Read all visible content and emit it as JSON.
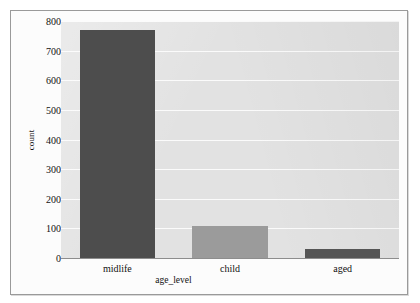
{
  "chart_data": {
    "type": "bar",
    "title": "",
    "subtitle": "",
    "xlabel": "age_level",
    "ylabel": "count",
    "categories": [
      "midlife",
      "child",
      "aged"
    ],
    "values": [
      770,
      107,
      30
    ],
    "series": [
      {
        "name": "count",
        "values": [
          770,
          107,
          30
        ]
      }
    ],
    "ylim": [
      0,
      800
    ],
    "yticks": [
      0,
      100,
      200,
      300,
      400,
      500,
      600,
      700,
      800
    ],
    "ytick_labels": [
      "0",
      "100",
      "200",
      "300",
      "400",
      "500",
      "600",
      "700",
      "800"
    ],
    "grid": true,
    "grid_axis": "y",
    "legend": false,
    "legend_position": "none",
    "bar_colors": [
      "#4d4d4d",
      "#9b9b9b",
      "#555555"
    ],
    "plot_background": "#e2e2e2",
    "gridline_color": "#fbfbfb",
    "axis_color": "#8d8d8d",
    "text_color": "#111111"
  },
  "figure": {
    "frame_border_color": "#9a9a9a",
    "page_background": "#fdfdfd"
  }
}
